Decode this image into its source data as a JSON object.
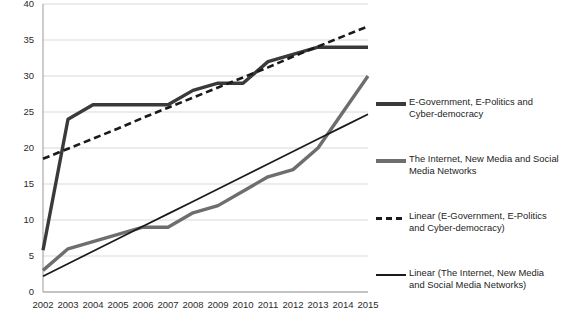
{
  "chart_data": {
    "type": "line",
    "title": "",
    "xlabel": "",
    "ylabel": "",
    "ylim": [
      0,
      40
    ],
    "ytick_values": [
      0,
      5,
      10,
      15,
      20,
      25,
      30,
      35,
      40
    ],
    "grid": true,
    "legend_position": "right",
    "categories": [
      "2002",
      "2003",
      "2004",
      "2005",
      "2006",
      "2007",
      "2008",
      "2009",
      "2010",
      "2011",
      "2012",
      "2013",
      "2014",
      "2015"
    ],
    "series": [
      {
        "name": "E-Government, E-Politics and Cyber-democracy",
        "style": "thick-solid",
        "color": "#3a3a3a",
        "values": [
          5.8,
          24,
          26,
          26,
          26,
          26,
          28,
          29,
          29,
          32,
          33,
          34,
          34,
          34
        ]
      },
      {
        "name": "The Internet, New Media and Social Media Networks",
        "style": "thick-solid",
        "color": "#6e6e6e",
        "values": [
          3,
          6,
          7,
          8,
          9,
          9,
          11,
          12,
          14,
          16,
          17,
          20,
          25,
          30
        ]
      },
      {
        "name": "Linear (E-Government, E-Politics and Cyber-democracy)",
        "style": "dashed-trendline",
        "color": "#1a1a1a",
        "values": [
          18.5,
          19.9,
          21.3,
          22.7,
          24.2,
          25.6,
          27.0,
          28.4,
          29.8,
          31.2,
          32.7,
          34.1,
          35.5,
          36.9
        ]
      },
      {
        "name": "Linear (The Internet, New Media and Social Media Networks)",
        "style": "thin-solid",
        "color": "#1a1a1a",
        "values": [
          2.2,
          3.93,
          5.66,
          7.39,
          9.12,
          10.85,
          12.58,
          14.32,
          16.05,
          17.78,
          19.51,
          21.24,
          22.97,
          24.7
        ]
      }
    ]
  },
  "legend": {
    "items": [
      {
        "label": "E-Government, E-Politics and Cyber-democracy",
        "swatch": "thick-dark-line-icon"
      },
      {
        "label": "The Internet, New Media and Social Media Networks",
        "swatch": "thick-gray-line-icon"
      },
      {
        "label": "Linear (E-Government, E-Politics and Cyber-democracy)",
        "swatch": "dashed-line-icon"
      },
      {
        "label": "Linear (The Internet, New Media and Social Media Networks)",
        "swatch": "thin-line-icon"
      }
    ]
  },
  "axes": {
    "y_ticks": [
      "40",
      "35",
      "30",
      "25",
      "20",
      "15",
      "10",
      "5",
      "0"
    ],
    "x_ticks": [
      "2002",
      "2003",
      "2004",
      "2005",
      "2006",
      "2007",
      "2008",
      "2009",
      "2010",
      "2011",
      "2012",
      "2013",
      "2014",
      "2015"
    ]
  }
}
